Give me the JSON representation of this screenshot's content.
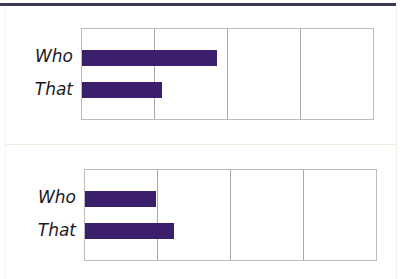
{
  "colors": {
    "bar": "#3b1f6b",
    "top_rule": "#3d3a55",
    "grid": "#a9a9a9",
    "frame": "#bdbdbd"
  },
  "chart_data": [
    {
      "type": "bar",
      "orientation": "horizontal",
      "title": "",
      "xlabel": "",
      "ylabel": "",
      "categories": [
        "Who",
        "That"
      ],
      "values": [
        1.85,
        1.1
      ],
      "xlim": [
        0,
        4
      ],
      "grid": true,
      "grid_lines_x": [
        1,
        2,
        3
      ],
      "legend": null,
      "note": "No numeric tick labels shown; values expressed in grid units (4 equal columns)."
    },
    {
      "type": "bar",
      "orientation": "horizontal",
      "title": "",
      "xlabel": "",
      "ylabel": "",
      "categories": [
        "Who",
        "That"
      ],
      "values": [
        0.97,
        1.23
      ],
      "xlim": [
        0,
        4
      ],
      "grid": true,
      "grid_lines_x": [
        1,
        2,
        3
      ],
      "legend": null,
      "note": "No numeric tick labels shown; values expressed in grid units (4 equal columns)."
    }
  ],
  "charts": [
    {
      "labels": [
        "Who",
        "That"
      ]
    },
    {
      "labels": [
        "Who",
        "That"
      ]
    }
  ]
}
